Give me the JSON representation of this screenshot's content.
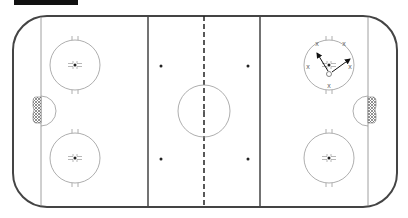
{
  "diagram": {
    "type": "hockey-rink-drill",
    "header_bar_label": "",
    "colors": {
      "boards": "#444444",
      "lines": "#555555",
      "circles": "#999999",
      "goal_fill": "#888888",
      "arrow": "#111111",
      "header": "#111111"
    },
    "icons": {
      "player_marker": "circle-o",
      "cone_marker": "x"
    },
    "markers": {
      "x_label": "x",
      "o_label": "o"
    }
  }
}
